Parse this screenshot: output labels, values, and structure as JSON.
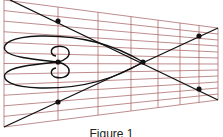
{
  "figure": {
    "caption": "Figure 1",
    "grid_color": "#a45a5a",
    "line_color": "#111111",
    "background": "#ffffff",
    "perspective_grid": {
      "left_edge": {
        "x": 4,
        "top": 0,
        "bottom": 127
      },
      "right_edge": {
        "x": 218,
        "top": 28,
        "bottom": 100
      },
      "vertical_lines_x": [
        4,
        58,
        98,
        131,
        158,
        180,
        199,
        218
      ],
      "horizontal_line_count": 12
    },
    "diagonals": [
      {
        "from": [
          10,
          0
        ],
        "to": [
          218,
          100
        ]
      },
      {
        "from": [
          4,
          127
        ],
        "to": [
          218,
          28
        ]
      }
    ],
    "points": [
      {
        "x": 58,
        "y": 21
      },
      {
        "x": 58,
        "y": 62
      },
      {
        "x": 58,
        "y": 102
      },
      {
        "x": 143,
        "y": 62
      },
      {
        "x": 199,
        "y": 36
      },
      {
        "x": 199,
        "y": 89
      }
    ]
  }
}
